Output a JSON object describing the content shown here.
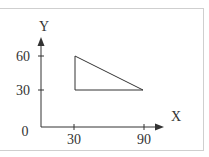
{
  "diagram": {
    "type": "coordinate-plane-triangle",
    "axes": {
      "x_label": "X",
      "y_label": "Y",
      "origin_label": "0",
      "x_ticks": [
        "30",
        "90"
      ],
      "y_ticks": [
        "30",
        "60"
      ]
    },
    "triangle": {
      "vertices": [
        [
          30,
          60
        ],
        [
          30,
          30
        ],
        [
          90,
          30
        ]
      ]
    },
    "colors": {
      "line": "#333333",
      "frame": "#cfcfcf",
      "background": "#ffffff"
    }
  }
}
